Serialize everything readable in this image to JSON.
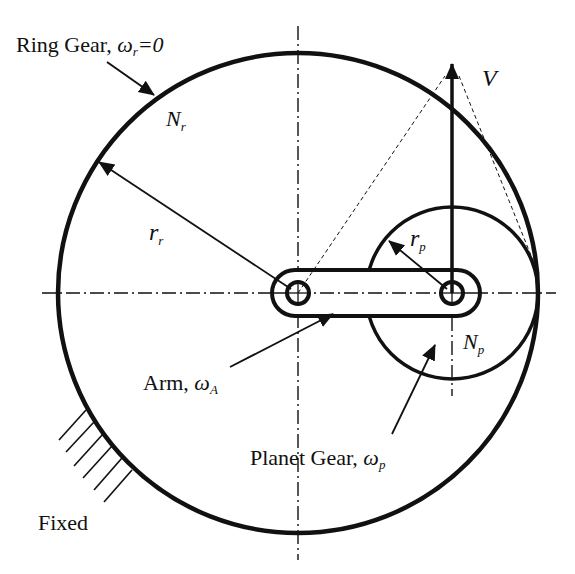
{
  "diagram": {
    "type": "planetary-gear-train",
    "colors": {
      "stroke": "#111111",
      "background": "#ffffff"
    },
    "labels": {
      "ring_gear": "Ring Gear, ",
      "ring_omega": "ω",
      "ring_omega_sub": "r",
      "ring_omega_eq": "=0",
      "ring_teeth": "N",
      "ring_teeth_sub": "r",
      "ring_radius": "r",
      "ring_radius_sub": "r",
      "planet_radius": "r",
      "planet_radius_sub": "p",
      "velocity": "V",
      "planet_teeth": "N",
      "planet_teeth_sub": "p",
      "arm": "Arm, ",
      "arm_omega": "ω",
      "arm_omega_sub": "A",
      "planet_gear": "Planet Gear, ",
      "planet_omega": "ω",
      "planet_omega_sub": "p",
      "fixed": "Fixed"
    },
    "components": [
      {
        "name": "Ring Gear",
        "angular_velocity": "ωr = 0",
        "teeth": "Nr",
        "radius": "rr"
      },
      {
        "name": "Planet Gear",
        "angular_velocity": "ωp",
        "teeth": "Np",
        "radius": "rp"
      },
      {
        "name": "Arm",
        "angular_velocity": "ωA"
      }
    ]
  }
}
